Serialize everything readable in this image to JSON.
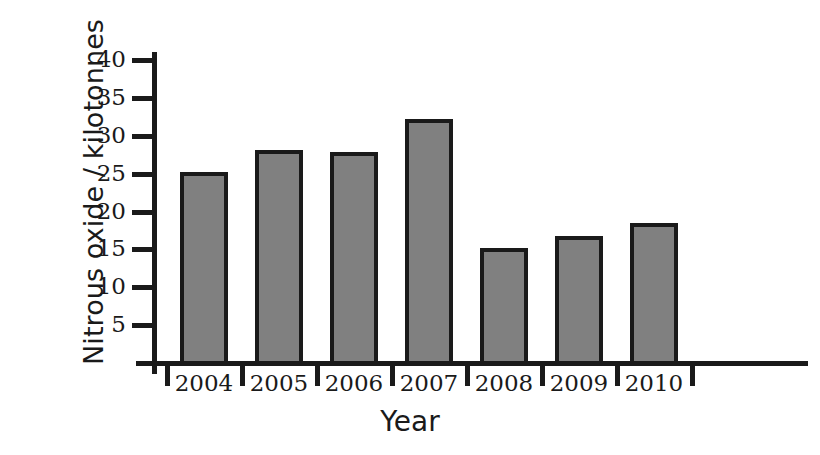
{
  "chart_data": {
    "type": "bar",
    "title": "",
    "xlabel": "Year",
    "ylabel": "Nitrous oxide / kilotonnes",
    "categories": [
      "2004",
      "2005",
      "2006",
      "2007",
      "2008",
      "2009",
      "2010"
    ],
    "values": [
      25.2,
      28.2,
      27.9,
      32.2,
      15.2,
      16.8,
      18.5
    ],
    "series": [
      {
        "name": "Nitrous oxide",
        "values": [
          25.2,
          28.2,
          27.9,
          32.2,
          15.2,
          16.8,
          18.5
        ]
      }
    ],
    "ylim": [
      0,
      42
    ],
    "yticks": [
      5,
      10,
      15,
      20,
      25,
      30,
      35,
      40
    ],
    "ytick_labels": [
      "5",
      "10",
      "15",
      "20",
      "25",
      "30",
      "35",
      "40"
    ],
    "grid": false,
    "legend": false,
    "legend_position": "none",
    "bar_fill_color": "#808080",
    "bar_edge_color": "#1a1a1a",
    "axis_color": "#1a1a1a",
    "background_color": "#ffffff"
  }
}
